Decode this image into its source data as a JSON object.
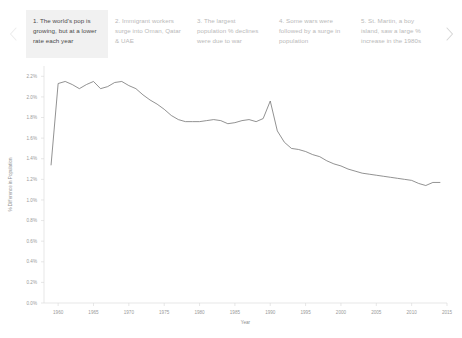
{
  "carousel": {
    "prev_label": "‹",
    "next_label": "›",
    "prev_icon": "chevron-left-icon",
    "next_icon": "chevron-right-icon",
    "active_index": 0,
    "cards": [
      {
        "text": "1. The world's pop is growing, but at a lower rate each year"
      },
      {
        "text": "2. Immigrant workers surge into Oman, Qatar & UAE"
      },
      {
        "text": "3. The largest population % declines were due to war"
      },
      {
        "text": "4. Some wars were followed by a surge in population"
      },
      {
        "text": "5. St. Martin, a boy island, saw a large % increase in the 1980s"
      }
    ]
  },
  "chart_data": {
    "type": "line",
    "title": "",
    "xlabel": "Year",
    "ylabel": "% Difference in Population",
    "xlim": [
      1958,
      2015
    ],
    "ylim": [
      0.0,
      2.3
    ],
    "grid": false,
    "legend": "none",
    "line_color": "#6e6e6e",
    "xticks": [
      1960,
      1965,
      1970,
      1975,
      1980,
      1985,
      1990,
      1995,
      2000,
      2005,
      2010,
      2015
    ],
    "xtick_labels": [
      "1960",
      "1965",
      "1970",
      "1975",
      "1980",
      "1985",
      "1990",
      "1995",
      "2000",
      "2005",
      "2010",
      "2015"
    ],
    "yticks": [
      0.0,
      0.2,
      0.4,
      0.6,
      0.8,
      1.0,
      1.2,
      1.4,
      1.6,
      1.8,
      2.0,
      2.2
    ],
    "ytick_labels": [
      "0.0%",
      "0.2%",
      "0.4%",
      "0.6%",
      "0.8%",
      "1.0%",
      "1.2%",
      "1.4%",
      "1.6%",
      "1.8%",
      "2.0%",
      "2.2%"
    ],
    "series": [
      {
        "name": "World population growth rate",
        "x": [
          1959,
          1960,
          1961,
          1962,
          1963,
          1964,
          1965,
          1966,
          1967,
          1968,
          1969,
          1970,
          1971,
          1972,
          1973,
          1974,
          1975,
          1976,
          1977,
          1978,
          1979,
          1980,
          1981,
          1982,
          1983,
          1984,
          1985,
          1986,
          1987,
          1988,
          1989,
          1990,
          1991,
          1992,
          1993,
          1994,
          1995,
          1996,
          1997,
          1998,
          1999,
          2000,
          2001,
          2002,
          2003,
          2004,
          2005,
          2006,
          2007,
          2008,
          2009,
          2010,
          2011,
          2012,
          2013,
          2014
        ],
        "values": [
          1.34,
          2.13,
          2.15,
          2.12,
          2.08,
          2.12,
          2.15,
          2.08,
          2.1,
          2.14,
          2.15,
          2.11,
          2.08,
          2.02,
          1.97,
          1.93,
          1.88,
          1.82,
          1.78,
          1.76,
          1.76,
          1.76,
          1.77,
          1.78,
          1.77,
          1.74,
          1.75,
          1.77,
          1.78,
          1.76,
          1.79,
          1.96,
          1.67,
          1.56,
          1.5,
          1.49,
          1.47,
          1.44,
          1.42,
          1.38,
          1.35,
          1.33,
          1.3,
          1.28,
          1.26,
          1.25,
          1.24,
          1.23,
          1.22,
          1.21,
          1.2,
          1.19,
          1.16,
          1.14,
          1.17,
          1.17
        ]
      }
    ]
  }
}
